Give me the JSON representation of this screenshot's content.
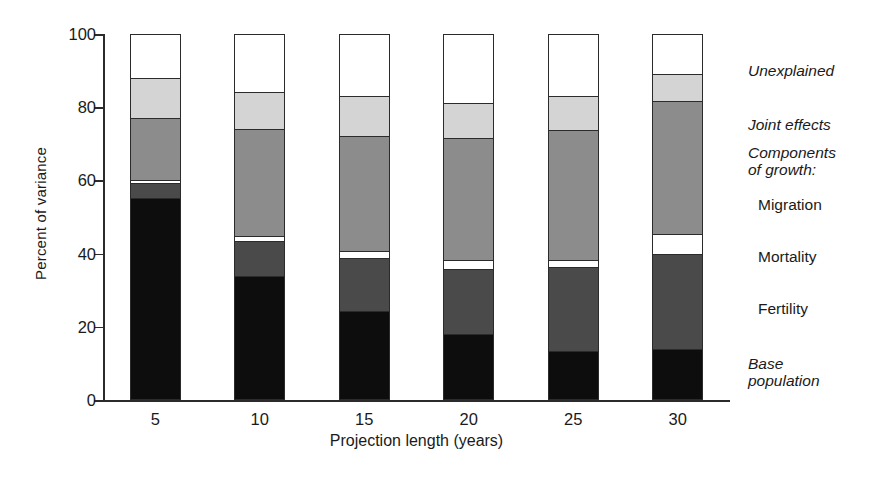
{
  "chart_data": {
    "type": "bar",
    "subtype": "stacked-bar-100",
    "title": "",
    "xlabel": "Projection length (years)",
    "ylabel": "Percent of variance",
    "categories": [
      "5",
      "10",
      "15",
      "20",
      "25",
      "30"
    ],
    "ylim": [
      0,
      100
    ],
    "yticks": [
      0,
      20,
      40,
      60,
      80,
      100
    ],
    "ytick_labels": [
      "0",
      "20",
      "40",
      "60",
      "80",
      "100"
    ],
    "grid": false,
    "legend_position": "right",
    "stack_order_bottom_to_top": [
      "Base population",
      "Fertility",
      "Mortality",
      "Migration",
      "Joint effects",
      "Unexplained"
    ],
    "series": [
      {
        "name": "Base population",
        "color": "#0d0d0d",
        "values": [
          55.0,
          33.5,
          24.0,
          17.5,
          13.0,
          13.5
        ]
      },
      {
        "name": "Fertility",
        "color": "#4a4a4a",
        "values": [
          4.0,
          9.5,
          14.5,
          18.0,
          23.0,
          26.0
        ]
      },
      {
        "name": "Mortality",
        "color": "#ffffff",
        "values": [
          1.0,
          1.5,
          2.0,
          2.5,
          2.0,
          5.5
        ]
      },
      {
        "name": "Migration",
        "color": "#8c8c8c",
        "values": [
          17.0,
          29.5,
          31.5,
          33.5,
          35.5,
          36.5
        ]
      },
      {
        "name": "Joint effects",
        "color": "#d4d4d4",
        "values": [
          11.0,
          10.0,
          11.0,
          9.5,
          9.5,
          7.5
        ]
      },
      {
        "name": "Unexplained",
        "color": "#ffffff",
        "values": [
          12.0,
          16.0,
          17.0,
          19.0,
          17.0,
          11.0
        ]
      }
    ],
    "cumulative_tops": {
      "5": [
        55.0,
        59.0,
        60.0,
        77.0,
        88.0,
        100.0
      ],
      "10": [
        33.5,
        43.0,
        44.5,
        74.0,
        84.0,
        100.0
      ],
      "15": [
        24.0,
        38.5,
        40.5,
        72.0,
        83.0,
        100.0
      ],
      "20": [
        17.5,
        35.5,
        38.0,
        71.5,
        81.0,
        100.0
      ],
      "25": [
        13.0,
        36.0,
        38.0,
        73.5,
        83.0,
        100.0
      ],
      "30": [
        13.5,
        39.5,
        45.0,
        81.5,
        89.0,
        100.0
      ]
    }
  },
  "legend": {
    "entries": [
      {
        "label": "Unexplained",
        "style": "italic"
      },
      {
        "label": "Joint effects",
        "style": "italic"
      },
      {
        "label": "Components\nof growth:",
        "style": "italic"
      },
      {
        "label": "Migration",
        "style": "plain"
      },
      {
        "label": "Mortality",
        "style": "plain"
      },
      {
        "label": "Fertility",
        "style": "plain"
      },
      {
        "label": "Base\npopulation",
        "style": "italic"
      }
    ]
  },
  "colors": {
    "axis": "#2b2b2b",
    "base_population": "#0d0d0d",
    "fertility": "#4a4a4a",
    "mortality": "#ffffff",
    "migration": "#8c8c8c",
    "joint_effects": "#d4d4d4",
    "unexplained": "#ffffff"
  }
}
